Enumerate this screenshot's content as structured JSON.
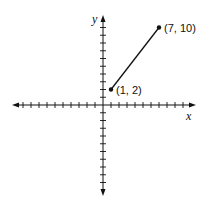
{
  "chart_data": {
    "type": "line",
    "title": "",
    "xlabel": "x",
    "ylabel": "y",
    "xlim": [
      -12,
      12
    ],
    "ylim": [
      -12,
      12
    ],
    "grid": false,
    "series": [
      {
        "name": "segment",
        "x": [
          1,
          7
        ],
        "y": [
          2,
          10
        ],
        "labels": [
          "(1, 2)",
          "(7, 10)"
        ]
      }
    ]
  },
  "axes": {
    "x_label": "x",
    "y_label": "y"
  },
  "points": [
    {
      "label": "(1, 2)",
      "x": 1,
      "y": 2
    },
    {
      "label": "(7, 10)",
      "x": 7,
      "y": 10
    }
  ],
  "colors": {
    "ink": "#111111",
    "background": "#ffffff"
  }
}
